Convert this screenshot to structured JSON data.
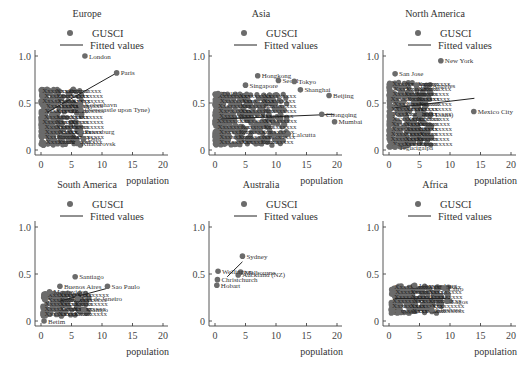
{
  "chart_data": [
    {
      "type": "scatter",
      "title": "Europe",
      "legend": [
        "GUSCI",
        "Fitted values"
      ],
      "xlabel": "population",
      "ylabel": "",
      "xlim": [
        0,
        20
      ],
      "ylim": [
        0,
        1.0
      ],
      "xticks": [
        "0",
        "5",
        "10",
        "15",
        "20"
      ],
      "yticks": [
        "0",
        "0.5",
        "1.0"
      ],
      "labeled_points": [
        {
          "label": "London",
          "x": 7.2,
          "y": 1.0
        },
        {
          "label": "Paris",
          "x": 12.4,
          "y": 0.82
        },
        {
          "label": "Kobenhavn",
          "x": 6.5,
          "y": 0.48
        },
        {
          "label": "(Newcastle upon Tyne)",
          "x": 6.5,
          "y": 0.43
        },
        {
          "label": "Petersburg",
          "x": 6.5,
          "y": 0.2
        },
        {
          "label": "Oslo",
          "x": 7.0,
          "y": 0.12
        },
        {
          "label": "Khabarovsk",
          "x": 6.0,
          "y": 0.07
        }
      ],
      "cluster": {
        "x_range": [
          0,
          7
        ],
        "y_range": [
          0.05,
          0.65
        ]
      },
      "fitted_line": {
        "x": [
          1,
          12.4
        ],
        "y": [
          0.4,
          0.82
        ]
      }
    },
    {
      "type": "scatter",
      "title": "Asia",
      "legend": [
        "GUSCI",
        "Fitted values"
      ],
      "xlabel": "population",
      "xlim": [
        0,
        20
      ],
      "ylim": [
        0,
        1.0
      ],
      "xticks": [
        "0",
        "5",
        "10",
        "15",
        "20"
      ],
      "yticks": [
        "0",
        "0.5",
        "1.0"
      ],
      "labeled_points": [
        {
          "label": "Hongkong",
          "x": 7.0,
          "y": 0.79
        },
        {
          "label": "Seoul",
          "x": 10.4,
          "y": 0.74
        },
        {
          "label": "Tokyo",
          "x": 13.0,
          "y": 0.73
        },
        {
          "label": "Singapore",
          "x": 5.0,
          "y": 0.69
        },
        {
          "label": "Shanghai",
          "x": 14.0,
          "y": 0.64
        },
        {
          "label": "Beijing",
          "x": 18.7,
          "y": 0.58
        },
        {
          "label": "Chongqing",
          "x": 17.5,
          "y": 0.38
        },
        {
          "label": "Mumbai",
          "x": 19.6,
          "y": 0.3
        },
        {
          "label": "Calcutta",
          "x": 12.0,
          "y": 0.17
        },
        {
          "label": "Delhi",
          "x": 0.5,
          "y": 0.6
        }
      ],
      "cluster": {
        "x_range": [
          0,
          12
        ],
        "y_range": [
          0.05,
          0.6
        ]
      },
      "fitted_line": {
        "x": [
          1,
          19.6
        ],
        "y": [
          0.33,
          0.38
        ]
      }
    },
    {
      "type": "scatter",
      "title": "North America",
      "legend": [
        "GUSCI",
        "Fitted values"
      ],
      "xlabel": "population",
      "xlim": [
        0,
        20
      ],
      "ylim": [
        0,
        1.0
      ],
      "xticks": [
        "0",
        "5",
        "10",
        "15",
        "20"
      ],
      "yticks": [
        "0",
        "0.5",
        "1.0"
      ],
      "labeled_points": [
        {
          "label": "New York",
          "x": 8.5,
          "y": 0.95
        },
        {
          "label": "San Jose",
          "x": 1.0,
          "y": 0.81
        },
        {
          "label": "Los Angeles",
          "x": 4.5,
          "y": 0.69
        },
        {
          "label": "Mexico City",
          "x": 13.9,
          "y": 0.41
        },
        {
          "label": "(St. Louis)",
          "x": 5.0,
          "y": 0.38
        },
        {
          "label": "Tegucigalpa",
          "x": 1.0,
          "y": 0.03
        }
      ],
      "cluster": {
        "x_range": [
          0,
          7
        ],
        "y_range": [
          0.03,
          0.72
        ]
      },
      "fitted_line": {
        "x": [
          1,
          14
        ],
        "y": [
          0.45,
          0.55
        ]
      }
    },
    {
      "type": "scatter",
      "title": "South America",
      "legend": [
        "GUSCI",
        "Fitted values"
      ],
      "xlabel": "population",
      "xlim": [
        0,
        20
      ],
      "ylim": [
        0,
        1.0
      ],
      "xticks": [
        "0",
        "5",
        "10",
        "15",
        "20"
      ],
      "yticks": [
        "0",
        "0.5",
        "1.0"
      ],
      "labeled_points": [
        {
          "label": "Santiago",
          "x": 5.6,
          "y": 0.47
        },
        {
          "label": "Buenos Aires",
          "x": 3.1,
          "y": 0.37
        },
        {
          "label": "Sao Paulo",
          "x": 10.9,
          "y": 0.37
        },
        {
          "label": "Montevideo",
          "x": 1.4,
          "y": 0.31
        },
        {
          "label": "Rio de Janeiro",
          "x": 6.0,
          "y": 0.24
        },
        {
          "label": "Campo",
          "x": 7.0,
          "y": 0.12
        },
        {
          "label": "Betim",
          "x": 0.5,
          "y": 0.0
        }
      ],
      "cluster": {
        "x_range": [
          0.3,
          8
        ],
        "y_range": [
          0.05,
          0.3
        ]
      },
      "fitted_line": {
        "x": [
          3,
          11
        ],
        "y": [
          0.21,
          0.35
        ]
      }
    },
    {
      "type": "scatter",
      "title": "Australia",
      "legend": [
        "GUSCI",
        "Fitted values"
      ],
      "xlabel": "population",
      "xlim": [
        0,
        20
      ],
      "ylim": [
        0,
        1.0
      ],
      "xticks": [
        "0",
        "5",
        "10",
        "15",
        "20"
      ],
      "yticks": [
        "0",
        "0.5",
        "1.0"
      ],
      "labeled_points": [
        {
          "label": "Sydney",
          "x": 4.5,
          "y": 0.69
        },
        {
          "label": "Melbourne",
          "x": 4.2,
          "y": 0.52
        },
        {
          "label": "Auckland (NZ)",
          "x": 3.8,
          "y": 0.49
        },
        {
          "label": "Wellington",
          "x": 0.5,
          "y": 0.53
        },
        {
          "label": "Christchurch",
          "x": 0.4,
          "y": 0.44
        },
        {
          "label": "Hobart",
          "x": 0.3,
          "y": 0.38
        }
      ],
      "fitted_line": {
        "x": [
          2.0,
          4.5
        ],
        "y": [
          0.47,
          0.63
        ]
      }
    },
    {
      "type": "scatter",
      "title": "Africa",
      "legend": [
        "GUSCI",
        "Fitted values"
      ],
      "xlabel": "population",
      "xlim": [
        0,
        20
      ],
      "ylim": [
        0,
        1.0
      ],
      "xticks": [
        "0",
        "5",
        "10",
        "15",
        "20"
      ],
      "yticks": [
        "0",
        "0.5",
        "1.0"
      ],
      "labeled_points": [
        {
          "label": "Johannesburg",
          "x": 4.2,
          "y": 0.38
        },
        {
          "label": "Cairo",
          "x": 9.0,
          "y": 0.35
        },
        {
          "label": "Lagos",
          "x": 9.5,
          "y": 0.21
        },
        {
          "label": "Kinshasa",
          "x": 7.0,
          "y": 0.12
        },
        {
          "label": "Lome",
          "x": 1.5,
          "y": 0.1
        }
      ],
      "cluster": {
        "x_range": [
          0.3,
          10
        ],
        "y_range": [
          0.08,
          0.38
        ]
      },
      "fitted_line": {
        "x": [
          1,
          10
        ],
        "y": [
          0.24,
          0.24
        ]
      }
    }
  ]
}
